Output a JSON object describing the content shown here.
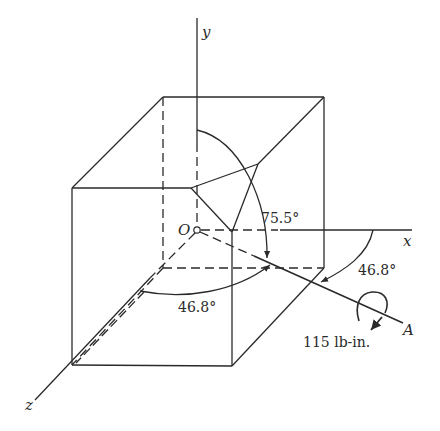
{
  "figure": {
    "axes": {
      "x_label": "x",
      "y_label": "y",
      "z_label": "z",
      "origin_label": "O"
    },
    "point_label": "A",
    "angles": {
      "theta_y": "75.5°",
      "theta_x": "46.8°",
      "theta_z": "46.8°"
    },
    "moment_label": "115 lb-in.",
    "colors": {
      "line": "#2a2a2a",
      "background": "#ffffff"
    }
  }
}
